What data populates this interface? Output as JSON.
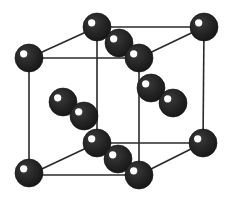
{
  "diagram": {
    "type": "crystal-unit-cell",
    "colors": {
      "atom": "#222222",
      "atom_highlight": "#ffffff",
      "edge": "#2a2a2a",
      "background": "#ffffff"
    },
    "atom_radius": 14,
    "cube": {
      "front": {
        "top_left": [
          29,
          58
        ],
        "top_right": [
          139,
          58
        ],
        "bottom_right": [
          139,
          175
        ],
        "bottom_left": [
          29,
          175
        ]
      },
      "back": {
        "top_left": [
          97,
          27
        ],
        "top_right": [
          204,
          27
        ],
        "bottom_right": [
          203,
          143
        ],
        "bottom_left": [
          97,
          143
        ]
      }
    },
    "atoms": [
      {
        "id": "back-top-left",
        "x": 97,
        "y": 27,
        "role": "corner"
      },
      {
        "id": "back-top-right",
        "x": 204,
        "y": 27,
        "role": "corner"
      },
      {
        "id": "top-face-inner",
        "x": 119,
        "y": 43,
        "role": "interior"
      },
      {
        "id": "front-top-right",
        "x": 139,
        "y": 58,
        "role": "corner"
      },
      {
        "id": "front-top-left",
        "x": 29,
        "y": 58,
        "role": "corner"
      },
      {
        "id": "right-pair-upper",
        "x": 151,
        "y": 88,
        "role": "interior"
      },
      {
        "id": "right-pair-lower",
        "x": 173,
        "y": 103,
        "role": "interior"
      },
      {
        "id": "left-pair-upper",
        "x": 63,
        "y": 102,
        "role": "interior"
      },
      {
        "id": "left-pair-lower",
        "x": 84,
        "y": 116,
        "role": "interior"
      },
      {
        "id": "back-bottom-left",
        "x": 97,
        "y": 143,
        "role": "corner"
      },
      {
        "id": "back-bottom-right",
        "x": 203,
        "y": 143,
        "role": "corner"
      },
      {
        "id": "bottom-face-inner",
        "x": 118,
        "y": 159,
        "role": "interior"
      },
      {
        "id": "front-bottom-left",
        "x": 29,
        "y": 173,
        "role": "corner"
      },
      {
        "id": "front-bottom-right",
        "x": 139,
        "y": 175,
        "role": "corner"
      }
    ]
  }
}
